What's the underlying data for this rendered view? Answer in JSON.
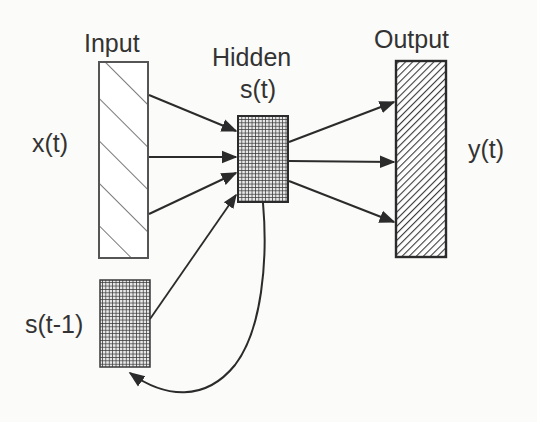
{
  "diagram": {
    "type": "recurrent-neural-network",
    "layers": {
      "input": {
        "title": "Input",
        "signal": "x(t)"
      },
      "hidden": {
        "title": "Hidden",
        "signal": "s(t)"
      },
      "output": {
        "title": "Output",
        "signal": "y(t)"
      },
      "context": {
        "signal": "s(t-1)"
      }
    },
    "connections": [
      {
        "from": "input",
        "to": "hidden",
        "count": 3
      },
      {
        "from": "context",
        "to": "hidden",
        "count": 1
      },
      {
        "from": "hidden",
        "to": "output",
        "count": 3
      },
      {
        "from": "hidden",
        "to": "context",
        "count": 1,
        "style": "curved-feedback"
      }
    ],
    "colors": {
      "stroke": "#2b2b2b",
      "grid_fill": "#5a5a5a",
      "background": "#fbfbf9"
    }
  }
}
